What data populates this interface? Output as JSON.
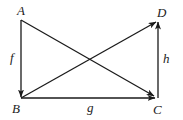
{
  "diagram": {
    "type": "commutative-diagram",
    "nodes": [
      {
        "id": "A",
        "label": "A",
        "x": 21,
        "y": 20
      },
      {
        "id": "B",
        "label": "B",
        "x": 21,
        "y": 98
      },
      {
        "id": "C",
        "label": "C",
        "x": 157,
        "y": 98
      },
      {
        "id": "D",
        "label": "D",
        "x": 157,
        "y": 21
      }
    ],
    "edges": [
      {
        "from": "A",
        "to": "B",
        "label": "f"
      },
      {
        "from": "B",
        "to": "C",
        "label": "g"
      },
      {
        "from": "C",
        "to": "D",
        "label": "h"
      },
      {
        "from": "A",
        "to": "C",
        "label": ""
      },
      {
        "from": "B",
        "to": "D",
        "label": ""
      }
    ],
    "colors": {
      "stroke": "#1a1a1a",
      "background": "#ffffff"
    }
  }
}
